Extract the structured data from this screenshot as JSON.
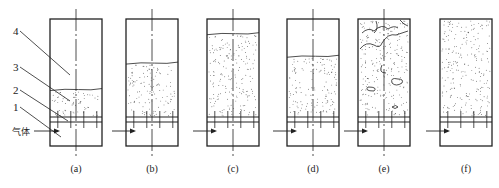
{
  "figure": {
    "panels": [
      {
        "id": "a",
        "caption": "(a)",
        "state": "fixed-bed",
        "bed_level": 0.28,
        "bubbles": false,
        "center_line": true,
        "arrow": true
      },
      {
        "id": "b",
        "caption": "(b)",
        "state": "incipient-fluidization",
        "bed_level": 0.55,
        "bubbles": false,
        "center_line": true,
        "arrow": true
      },
      {
        "id": "c",
        "caption": "(c)",
        "state": "particulate-fluidization",
        "bed_level": 0.85,
        "bubbles": false,
        "center_line": true,
        "arrow": true
      },
      {
        "id": "d",
        "caption": "(d)",
        "state": "fluidized-bed",
        "bed_level": 0.62,
        "bubbles": false,
        "center_line": true,
        "arrow": true
      },
      {
        "id": "e",
        "caption": "(e)",
        "state": "bubbling-fluidization",
        "bed_level": 1.0,
        "bubbles": true,
        "center_line": true,
        "arrow": true
      },
      {
        "id": "f",
        "caption": "(f)",
        "state": "pneumatic-transport",
        "bed_level": 1.0,
        "bubbles": false,
        "center_line": false,
        "arrow": true
      }
    ],
    "callouts": [
      {
        "number": "4",
        "target": "column-freeboard"
      },
      {
        "number": "3",
        "target": "particle-bed"
      },
      {
        "number": "2",
        "target": "distributor-plate"
      },
      {
        "number": "1",
        "target": "gas-chamber"
      }
    ],
    "gas_label": "气体",
    "colors": {
      "line": "#222222",
      "dots": "#333333",
      "background": "#ffffff"
    }
  }
}
